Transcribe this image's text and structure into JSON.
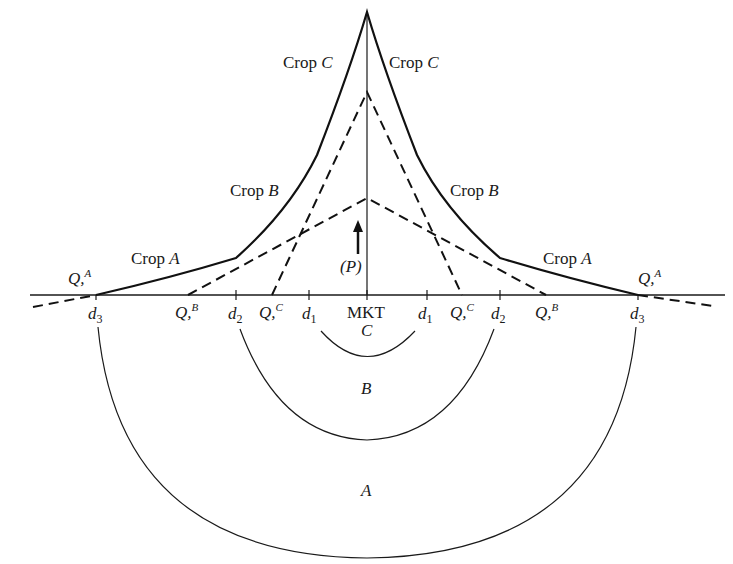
{
  "diagram": {
    "type": "bid-rent / von Thunen land use diagram",
    "center_label": "MKT",
    "price_label": "(P)",
    "crop_labels": {
      "C_left": {
        "word": "Crop",
        "letter": "C"
      },
      "C_right": {
        "word": "Crop",
        "letter": "C"
      },
      "B_left": {
        "word": "Crop",
        "letter": "B"
      },
      "B_right": {
        "word": "Crop",
        "letter": "B"
      },
      "A_left": {
        "word": "Crop",
        "letter": "A"
      },
      "A_right": {
        "word": "Crop",
        "letter": "A"
      }
    },
    "axis_labels": {
      "left": [
        {
          "type": "Q",
          "sup": "A"
        },
        {
          "type": "Q",
          "sup": "B"
        },
        {
          "type": "Q",
          "sup": "C"
        }
      ],
      "right": [
        {
          "type": "Q",
          "sup": "C"
        },
        {
          "type": "Q",
          "sup": "B"
        },
        {
          "type": "Q",
          "sup": "A"
        }
      ],
      "distances": [
        "d",
        "d",
        "d",
        "d",
        "d",
        "d"
      ],
      "distance_subs": [
        "3",
        "2",
        "1",
        "1",
        "2",
        "3"
      ],
      "q_text": "Q,"
    },
    "zones": {
      "inner": "C",
      "middle": "B",
      "outer": "A"
    }
  }
}
